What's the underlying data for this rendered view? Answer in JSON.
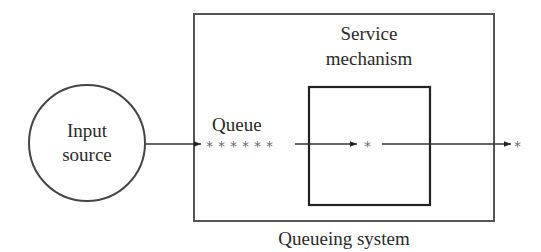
{
  "diagram": {
    "type": "queueing-system-flow",
    "nodes": {
      "input_source": {
        "line1": "Input",
        "line2": "source"
      },
      "queue": {
        "label": "Queue",
        "items": [
          "*",
          "*",
          "*",
          "*",
          "*",
          "*"
        ]
      },
      "service_mechanism": {
        "line1": "Service",
        "line2": "mechanism",
        "item": "*"
      },
      "output": {
        "item": "*"
      },
      "queueing_system": {
        "label": "Queueing system"
      }
    },
    "edges": [
      {
        "from": "input_source",
        "to": "queue"
      },
      {
        "from": "queue",
        "to": "service_mechanism"
      },
      {
        "from": "service_mechanism",
        "to": "output"
      }
    ],
    "colors": {
      "stroke": "#333333",
      "text": "#2a2a2a",
      "star": "#6a6a6a",
      "background": "#ffffff"
    }
  }
}
